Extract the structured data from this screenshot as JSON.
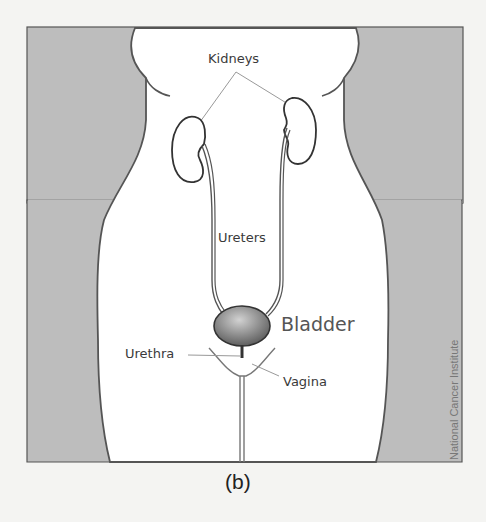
{
  "figure": {
    "caption": "(b)",
    "credit": "National Cancer Institute",
    "labels": {
      "kidneys": "Kidneys",
      "ureters": "Ureters",
      "bladder": "Bladder",
      "urethra": "Urethra",
      "vagina": "Vagina"
    },
    "colors": {
      "background_panel": "#bdbdbd",
      "body_fill": "#ffffff",
      "outline": "#555555",
      "bladder": "#8a8a8a",
      "leader_line": "#999999"
    }
  }
}
